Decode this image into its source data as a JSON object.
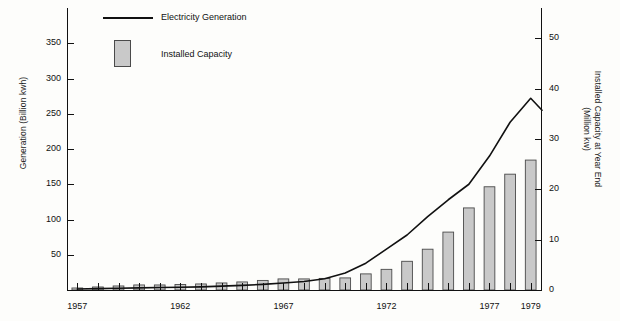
{
  "chart_data": {
    "type": "bar",
    "title": "",
    "subtitle": "",
    "xlabel": "",
    "ylabel": "Generation (Billion kwh)",
    "y2label": "Installed Capacity at Year End",
    "y2label_line2": "(Million kw)",
    "grid": false,
    "legend_position": "top-left",
    "xlim": [
      1957,
      1979
    ],
    "ylim": [
      0,
      400
    ],
    "y2lim": [
      0,
      56
    ],
    "yticks": [
      50,
      100,
      150,
      200,
      250,
      300,
      350
    ],
    "yticklabels": [
      "50",
      "100",
      "150",
      "200",
      "250",
      "300",
      "350"
    ],
    "y2ticks": [
      0,
      10,
      20,
      30,
      40,
      50
    ],
    "y2ticklabels": [
      "0",
      "10",
      "20",
      "30",
      "40",
      "50"
    ],
    "xticks": [
      1957,
      1962,
      1967,
      1972,
      1977,
      1979
    ],
    "xticklabels": [
      "1957",
      "1962",
      "1967",
      "1972",
      "1977",
      "1979"
    ],
    "categories": [
      1957,
      1958,
      1959,
      1960,
      1961,
      1962,
      1963,
      1964,
      1965,
      1966,
      1967,
      1968,
      1969,
      1970,
      1971,
      1972,
      1973,
      1974,
      1975,
      1976,
      1977,
      1978,
      1979
    ],
    "series": [
      {
        "name": "Installed Capacity",
        "axis": "right",
        "render": "bar",
        "color": "#c9c9c9",
        "edge_color": "#4a4a4a",
        "unit": "Million kw",
        "values": [
          0.4,
          0.6,
          0.8,
          1.0,
          1.0,
          1.1,
          1.2,
          1.4,
          1.6,
          1.9,
          2.2,
          2.2,
          2.3,
          2.4,
          3.2,
          4.1,
          5.7,
          8.1,
          11.5,
          16.3,
          20.5,
          23.0,
          25.8
        ]
      },
      {
        "name": "Electricity Generation",
        "axis": "left",
        "render": "line",
        "color": "#111111",
        "unit": "Billion kwh",
        "values": [
          1.5,
          2.0,
          2.5,
          3.0,
          3.5,
          4.0,
          4.5,
          5.5,
          6.5,
          8.0,
          10.0,
          12.0,
          16.0,
          24.0,
          38.0,
          58.0,
          78.0,
          104.0,
          128.0,
          150.0,
          190.0,
          238.0,
          272.0
        ]
      }
    ],
    "legend": [
      {
        "label": "Electricity Generation",
        "marker": "line"
      },
      {
        "label": "Installed Capacity",
        "marker": "swatch"
      }
    ],
    "bars_px": [
      {
        "year": 1957,
        "x": 135,
        "w": 9,
        "top": 288
      },
      {
        "year": 1958,
        "x": 152,
        "w": 9,
        "top": 287
      },
      {
        "year": 1959,
        "x": 169,
        "w": 9,
        "top": 286
      },
      {
        "year": 1960,
        "x": 186,
        "w": 9,
        "top": 285
      },
      {
        "year": 1961,
        "x": 203,
        "w": 9,
        "top": 285
      },
      {
        "year": 1962,
        "x": 220,
        "w": 9,
        "top": 284
      },
      {
        "year": 1963,
        "x": 237,
        "w": 9,
        "top": 284
      },
      {
        "year": 1964,
        "x": 254,
        "w": 9,
        "top": 283
      },
      {
        "year": 1965,
        "x": 271,
        "w": 9,
        "top": 281
      },
      {
        "year": 1966,
        "x": 288,
        "w": 9,
        "top": 279
      },
      {
        "year": 1967,
        "x": 305,
        "w": 9,
        "top": 277
      },
      {
        "year": 1968,
        "x": 322,
        "w": 9,
        "top": 277
      },
      {
        "year": 1969,
        "x": 339,
        "w": 9,
        "top": 276
      },
      {
        "year": 1970,
        "x": 356,
        "w": 9,
        "top": 275
      },
      {
        "year": 1971,
        "x": 355,
        "w": 0,
        "top": 275
      }
    ]
  }
}
